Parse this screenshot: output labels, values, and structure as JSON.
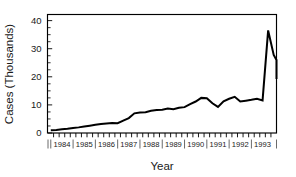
{
  "chart_data": {
    "type": "line",
    "title": "",
    "subtitle": "",
    "xlabel": "Year",
    "ylabel": "Cases (Thousands)",
    "ylim": [
      0,
      42
    ],
    "xlim": [
      1983.875,
      1994.125
    ],
    "grid": false,
    "legend": null,
    "legend_position": "none",
    "annotations": [],
    "ytick_labels": [
      "0",
      "10",
      "20",
      "30",
      "40"
    ],
    "ytick_values": [
      0,
      10,
      20,
      30,
      40
    ],
    "yminor_interval": 2.5,
    "xtick_labels": [
      "1984",
      "1985",
      "1986",
      "1987",
      "1988",
      "1989",
      "1990",
      "1991",
      "1992",
      "1993"
    ],
    "xtick_values": [
      1984,
      1985,
      1986,
      1987,
      1988,
      1989,
      1990,
      1991,
      1992,
      1993
    ],
    "xtick_minor_per_year": 4,
    "series": [
      {
        "name": "Cases",
        "x": [
          1984.0,
          1984.25,
          1984.5,
          1984.75,
          1985.0,
          1985.25,
          1985.5,
          1985.75,
          1986.0,
          1986.25,
          1986.5,
          1986.75,
          1987.0,
          1987.25,
          1987.5,
          1987.75,
          1988.0,
          1988.25,
          1988.5,
          1988.75,
          1989.0,
          1989.25,
          1989.5,
          1989.75,
          1990.0,
          1990.25,
          1990.5,
          1990.75,
          1991.0,
          1991.25,
          1991.5,
          1991.75,
          1992.0,
          1992.25,
          1992.5,
          1992.75,
          1993.0,
          1993.25,
          1993.5,
          1993.75
        ],
        "values": [
          1.0,
          1.1,
          1.3,
          1.5,
          1.8,
          2.0,
          2.3,
          2.6,
          2.9,
          3.2,
          3.4,
          3.6,
          3.5,
          4.4,
          5.3,
          7.0,
          7.3,
          7.4,
          7.9,
          8.2,
          8.3,
          8.7,
          8.5,
          9.0,
          9.2,
          10.3,
          11.2,
          12.5,
          12.4,
          10.6,
          9.3,
          11.3,
          12.2,
          12.9,
          11.2,
          11.5,
          11.8,
          12.2,
          11.6,
          36.5
        ]
      }
    ],
    "tail_values": [
      36.5,
      27.8,
      26.0,
      25.8,
      22.3,
      19.2
    ],
    "peak": {
      "value": 36.5,
      "approx_x": "late 1993"
    },
    "end_value": 19.2
  },
  "labels": {
    "ylabel": "Cases (Thousands)",
    "xlabel": "Year"
  },
  "colors": {
    "line": "#000000",
    "frame": "#000000",
    "text": "#1a1a1a",
    "background": "#ffffff"
  }
}
